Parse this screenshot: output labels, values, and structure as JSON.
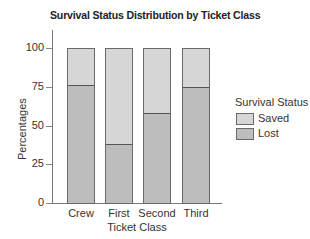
{
  "chart_data": {
    "type": "bar",
    "stacked": true,
    "title": "Survival Status Distribution by Ticket Class",
    "xlabel": "Ticket Class",
    "ylabel": "Percentages",
    "categories": [
      "Crew",
      "First",
      "Second",
      "Third"
    ],
    "series": [
      {
        "name": "Lost",
        "color": "#bdbdbd",
        "values": [
          76,
          38,
          58,
          75
        ]
      },
      {
        "name": "Saved",
        "color": "#d6d6d6",
        "values": [
          24,
          62,
          42,
          25
        ]
      }
    ],
    "ylim": [
      0,
      100
    ],
    "yticks": [
      0,
      25,
      50,
      75,
      100
    ],
    "grid": false,
    "legend": {
      "title": "Survival Status",
      "position": "right",
      "entries": [
        "Saved",
        "Lost"
      ]
    }
  },
  "legend": {
    "title": "Survival Status",
    "items": [
      {
        "label": "Saved",
        "color": "#d6d6d6"
      },
      {
        "label": "Lost",
        "color": "#bdbdbd"
      }
    ]
  }
}
